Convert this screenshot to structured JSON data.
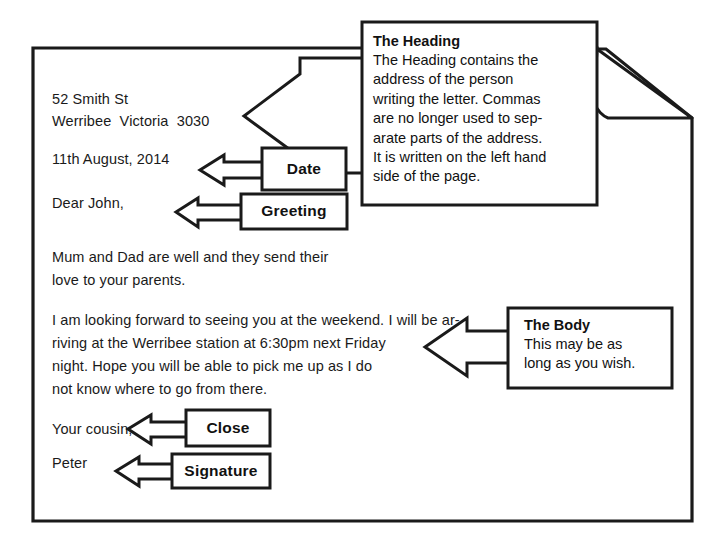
{
  "diagram": {
    "page": {
      "name": "letter-page",
      "corner_fold": true
    },
    "letter": {
      "heading": {
        "line1": "52 Smith St",
        "line2": "Werribee  Victoria  3030"
      },
      "date": "11th August, 2014",
      "greeting": "Dear John,",
      "body_paragraph_1": [
        "Mum and Dad are well and they send their",
        "love to your parents."
      ],
      "body_paragraph_2": [
        "I am looking forward to seeing you at the weekend. I will be ar-",
        "riving at the Werribee station at 6:30pm next Friday",
        "night. Hope you will be able to pick me up as I do",
        "not know where to go from there."
      ],
      "close": "Your cousin,",
      "signature": "Peter"
    },
    "labels": {
      "date": "Date",
      "greeting": "Greeting",
      "close": "Close",
      "signature": "Signature"
    },
    "callouts": {
      "heading": {
        "title": "The Heading",
        "lines": [
          "The Heading contains the",
          "address of the person",
          "writing the letter. Commas",
          "are no longer used to sep-",
          "arate parts of the address.",
          "It is written on the left hand",
          "side of the page."
        ]
      },
      "body": {
        "title": "The Body",
        "lines": [
          "This may be as",
          "long as you wish."
        ]
      }
    },
    "colors": {
      "ink": "#111111",
      "paper": "#ffffff",
      "stroke": "#1a1a1a"
    }
  }
}
